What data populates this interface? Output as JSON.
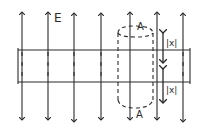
{
  "diagram": {
    "field_label": "E",
    "area_label_top": "A",
    "area_label_bottom": "A",
    "distance_label_top": "|x|",
    "distance_label_bottom": "|x|",
    "field_lines_x": [
      22,
      48,
      74,
      101,
      130,
      157,
      183
    ],
    "stroke_color": "#2a2a2a",
    "background_color": "#ffffff"
  }
}
